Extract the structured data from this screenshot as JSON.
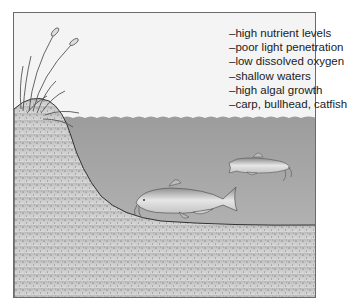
{
  "diagram": {
    "type": "illustration",
    "characteristics": [
      "–high nutrient levels",
      "–poor light penetration",
      "–low dissolved oxygen",
      "–shallow waters",
      "–high algal growth",
      "–carp, bullhead, catfish"
    ],
    "elements": [
      "cattail-reeds",
      "shoreline-bank",
      "water-surface",
      "lake-bottom-sediment",
      "bullhead-fish",
      "catfish"
    ],
    "colors": {
      "sky": "#f4f4f4",
      "water": "#a9a9a9",
      "sediment": "#c8c8c8",
      "outline": "#333333"
    }
  }
}
